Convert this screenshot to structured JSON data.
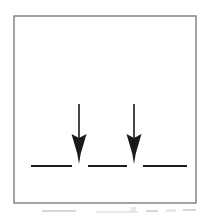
{
  "figure": {
    "title": "Two downward arrows converging on a dashed horizontal line",
    "background_color": "#ffffff",
    "ink_color": "#1a1a1a",
    "frame": {
      "name": "outer-frame",
      "x": 14,
      "y": 16,
      "width": 182,
      "height": 187,
      "stroke_color": "#7d7d7d",
      "stroke_width": 1.4,
      "fill": "#ffffff"
    },
    "dashed_line": {
      "name": "dashed-baseline",
      "y": 166,
      "stroke_color": "#1f1f1f",
      "stroke_width": 2.2,
      "segments": [
        {
          "label": "dash-1",
          "x1": 31,
          "x2": 72
        },
        {
          "label": "dash-2",
          "x1": 88,
          "x2": 127
        },
        {
          "label": "dash-3",
          "x1": 143,
          "x2": 187
        }
      ]
    },
    "arrows": [
      {
        "label": "arrow-left",
        "x": 79,
        "shaft_top_y": 104,
        "shaft_bottom_y": 140,
        "tip_y": 164,
        "head_top_y": 134,
        "head_half_width": 7.5,
        "barb_inset_y": 154,
        "shaft_width": 1.6,
        "color": "#1a1a1a",
        "direction": "down"
      },
      {
        "label": "arrow-right",
        "x": 134,
        "shaft_top_y": 104,
        "shaft_bottom_y": 140,
        "tip_y": 164,
        "head_top_y": 134,
        "head_half_width": 7.5,
        "barb_inset_y": 154,
        "shaft_width": 1.6,
        "color": "#1a1a1a",
        "direction": "down"
      }
    ],
    "scan_artifacts": [
      {
        "label": "artifact-a",
        "x": 42,
        "y": 210,
        "width": 34,
        "height": 2
      },
      {
        "label": "artifact-b",
        "x": 96,
        "y": 211,
        "width": 42,
        "height": 2
      },
      {
        "label": "artifact-c",
        "x": 146,
        "y": 210,
        "width": 12,
        "height": 2
      },
      {
        "label": "artifact-d",
        "x": 166,
        "y": 209,
        "width": 10,
        "height": 3
      },
      {
        "label": "artifact-e",
        "x": 183,
        "y": 209,
        "width": 13,
        "height": 2
      },
      {
        "label": "artifact-f",
        "x": 130,
        "y": 207,
        "width": 6,
        "height": 4
      }
    ]
  }
}
